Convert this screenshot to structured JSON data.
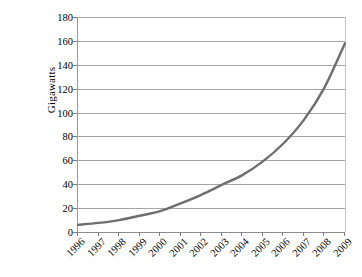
{
  "chart_data": {
    "type": "line",
    "title": "",
    "xlabel": "",
    "ylabel": "Gigawatts",
    "ylim": [
      0,
      180
    ],
    "yticks": [
      0,
      20,
      40,
      60,
      80,
      100,
      120,
      140,
      160,
      180
    ],
    "ytick_labels": [
      "0",
      "20",
      "40",
      "60",
      "80",
      "100",
      "120",
      "140",
      "160",
      "180"
    ],
    "grid": true,
    "legend": "none",
    "categories": [
      "1996",
      "1997",
      "1998",
      "1999",
      "2000",
      "2001",
      "2002",
      "2003",
      "2004",
      "2005",
      "2006",
      "2007",
      "2008",
      "2009"
    ],
    "x": [
      1996,
      1997,
      1998,
      1999,
      2000,
      2001,
      2002,
      2003,
      2004,
      2005,
      2006,
      2007,
      2008,
      2009
    ],
    "series": [
      {
        "name": "Installed capacity",
        "color": "#6e6e6e",
        "values": [
          6,
          7.6,
          10,
          13.6,
          17.4,
          23.9,
          31.1,
          39.4,
          47.6,
          59.1,
          74.1,
          93.9,
          120.9,
          158
        ]
      }
    ]
  },
  "axes": {
    "y_title": "Gigawatts"
  },
  "style": {
    "line_color": "#6e6e6e",
    "grid_color": "#a6a6a6",
    "axis_color": "#8d8d8d",
    "text_color": "#000000",
    "background": "#ffffff"
  }
}
